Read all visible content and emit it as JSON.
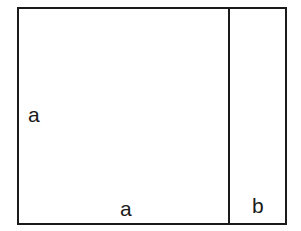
{
  "diagram": {
    "shapes": [
      {
        "type": "rectangle",
        "label": "square a×a"
      },
      {
        "type": "rectangle",
        "label": "strip a×b"
      }
    ],
    "labels": {
      "left_side": "a",
      "bottom_left": "a",
      "bottom_right": "b"
    },
    "colors": {
      "stroke": "#1a1a1a",
      "background": "#ffffff"
    }
  }
}
